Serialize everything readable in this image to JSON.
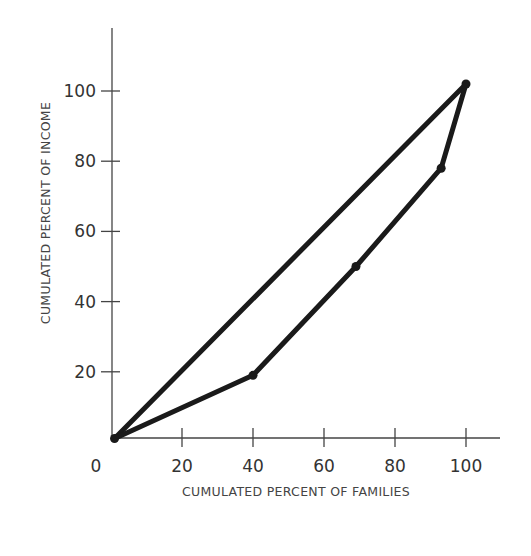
{
  "chart_data": {
    "type": "line",
    "title": "",
    "xlabel": "CUMULATED PERCENT OF FAMILIES",
    "ylabel": "CUMULATED PERCENT OF INCOME",
    "xlim": [
      0,
      110
    ],
    "ylim": [
      0,
      118
    ],
    "x_ticks": [
      0,
      20,
      40,
      60,
      80,
      100
    ],
    "y_ticks": [
      20,
      40,
      60,
      80,
      100
    ],
    "x_tick_labels": [
      "0",
      "20",
      "40",
      "60",
      "80",
      "100"
    ],
    "y_tick_labels": [
      "20",
      "40",
      "60",
      "80",
      "100"
    ],
    "grid": false,
    "legend": null,
    "series": [
      {
        "name": "Line of equality",
        "x": [
          1,
          100
        ],
        "y": [
          1,
          102
        ],
        "markers": false
      },
      {
        "name": "Lorenz curve",
        "x": [
          1,
          40,
          69,
          93,
          100
        ],
        "y": [
          1,
          19,
          50,
          78,
          102
        ],
        "markers": true
      }
    ],
    "line_color": "#1a1a1a"
  }
}
